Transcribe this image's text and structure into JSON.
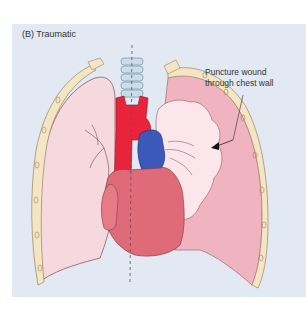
{
  "figure": {
    "panel_label": "(B) Traumatic",
    "annotation": {
      "line1": "Puncture wound",
      "line2": "through chest wall"
    },
    "colors": {
      "panel_background": "#e3e9f2",
      "normal_lung": "#f6d8df",
      "collapsed_lung_space": "#f0b4c0",
      "collapsed_lung": "#fbe6ec",
      "heart": "#e06b78",
      "aorta_artery": "#e8243c",
      "vein": "#3b59b8",
      "trachea": "#c9dce8",
      "chest_wall": "#f3e6c4",
      "outline": "#8a5a5a"
    },
    "structures": [
      "chest-wall-left",
      "chest-wall-right",
      "normal-left-lung",
      "collapsed-right-lung",
      "pleural-air-space",
      "trachea",
      "aorta",
      "superior-vena-cava",
      "heart",
      "midline-dashed",
      "puncture-arrow"
    ]
  }
}
